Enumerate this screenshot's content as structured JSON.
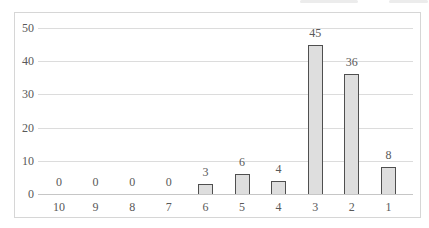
{
  "chart_data": {
    "type": "bar",
    "title": "",
    "xlabel": "",
    "ylabel": "",
    "categories": [
      "10",
      "9",
      "8",
      "7",
      "6",
      "5",
      "4",
      "3",
      "2",
      "1"
    ],
    "values": [
      0,
      0,
      0,
      0,
      3,
      6,
      4,
      45,
      36,
      8
    ],
    "ylim": [
      0,
      50
    ],
    "yticks": [
      0,
      10,
      20,
      30,
      40,
      50
    ],
    "grid": true,
    "legend": false,
    "data_labels": true,
    "colors": {
      "bar_fill": "#dedede",
      "bar_border": "#4f4f4f",
      "gridline": "#dcdcdc",
      "axis_line": "#c6c6c6",
      "frame_border": "#d6d6d6",
      "text": "#595959",
      "background": "#ffffff"
    }
  }
}
